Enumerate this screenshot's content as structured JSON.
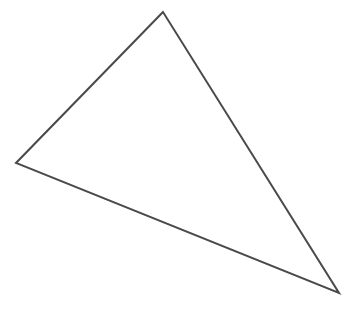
{
  "diagram": {
    "type": "triangle",
    "background": "#ffffff",
    "stroke_color": "#4a4a4a",
    "stroke_width": 2,
    "fill": "none",
    "vertices": [
      {
        "name": "top",
        "x": 163,
        "y": 12
      },
      {
        "name": "left",
        "x": 16,
        "y": 163
      },
      {
        "name": "bottom-right",
        "x": 339,
        "y": 293
      }
    ]
  }
}
